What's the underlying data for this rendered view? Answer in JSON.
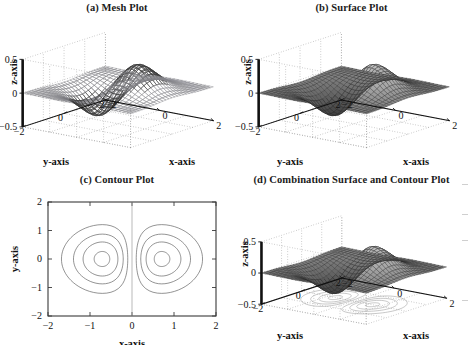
{
  "figure": {
    "background": "#ffffff",
    "ink": "#111111",
    "panels": [
      {
        "id": "a",
        "title": "(a) Mesh Plot",
        "type": "mesh3d",
        "axis_labels": {
          "x": "x-axis",
          "y": "y-axis",
          "z": "z-axis"
        },
        "x_ticks": [
          "-2",
          "0",
          "2"
        ],
        "y_ticks": [
          "2",
          "0",
          "-2"
        ],
        "z_ticks": [
          "0.5",
          "0",
          "-0.5"
        ]
      },
      {
        "id": "b",
        "title": "(b) Surface Plot",
        "type": "surface3d",
        "axis_labels": {
          "x": "x-axis",
          "y": "y-axis",
          "z": "z-axis"
        },
        "x_ticks": [
          "-2",
          "0",
          "2"
        ],
        "y_ticks": [
          "2",
          "0",
          "-2"
        ],
        "z_ticks": [
          "0.5",
          "0",
          "-0.5"
        ]
      },
      {
        "id": "c",
        "title": "(c) Contour Plot",
        "type": "contour2d",
        "axis_labels": {
          "x": "x-axis",
          "y": "y-axis"
        },
        "x_ticks": [
          "-2",
          "-1",
          "0",
          "1",
          "2"
        ],
        "y_ticks": [
          "2",
          "1",
          "0",
          "-1",
          "-2"
        ]
      },
      {
        "id": "d",
        "title": "(d) Combination Surface and Contour Plot",
        "type": "surface3d_with_floor_contour",
        "axis_labels": {
          "x": "x-axis",
          "y": "y-axis",
          "z": "z-axis"
        },
        "x_ticks": [
          "-2",
          "0",
          "2"
        ],
        "y_ticks": [
          "2",
          "0",
          "-2"
        ],
        "z_ticks": [
          "0.5",
          "0",
          "-0.5"
        ]
      }
    ]
  },
  "chart_data": {
    "type": "surface",
    "function": "z = x * exp(-x^2 - y^2)",
    "xlabel": "x-axis",
    "ylabel": "y-axis",
    "zlabel": "z-axis",
    "xlim": [
      -2,
      2
    ],
    "ylim": [
      -2,
      2
    ],
    "zlim": [
      -0.5,
      0.5
    ],
    "xticks": [
      -2,
      0,
      2
    ],
    "yticks": [
      -2,
      0,
      2
    ],
    "zticks": [
      -0.5,
      0,
      0.5
    ],
    "contour_xticks": [
      -2,
      -1,
      0,
      1,
      2
    ],
    "contour_yticks": [
      -2,
      -1,
      0,
      1,
      2
    ],
    "grid": true,
    "legend": false,
    "grid_n": 29,
    "extrema": [
      {
        "label": "maximum",
        "x": 0.7071,
        "y": 0.0,
        "z": 0.4289
      },
      {
        "label": "minimum",
        "x": -0.7071,
        "y": 0.0,
        "z": -0.4289
      }
    ],
    "contour_levels": [
      -0.4,
      -0.3,
      -0.2,
      -0.1,
      0.1,
      0.2,
      0.3,
      0.4
    ],
    "view": {
      "azimuth": -37.5,
      "elevation": 30
    },
    "panels": [
      {
        "id": "a",
        "render": "mesh",
        "faces": false,
        "title": "(a) Mesh Plot"
      },
      {
        "id": "b",
        "render": "surf",
        "faces": true,
        "title": "(b) Surface Plot"
      },
      {
        "id": "c",
        "render": "contour",
        "faces": false,
        "title": "(c) Contour Plot"
      },
      {
        "id": "d",
        "render": "surfc",
        "faces": true,
        "title": "(d) Combination Surface and Contour Plot"
      }
    ]
  }
}
